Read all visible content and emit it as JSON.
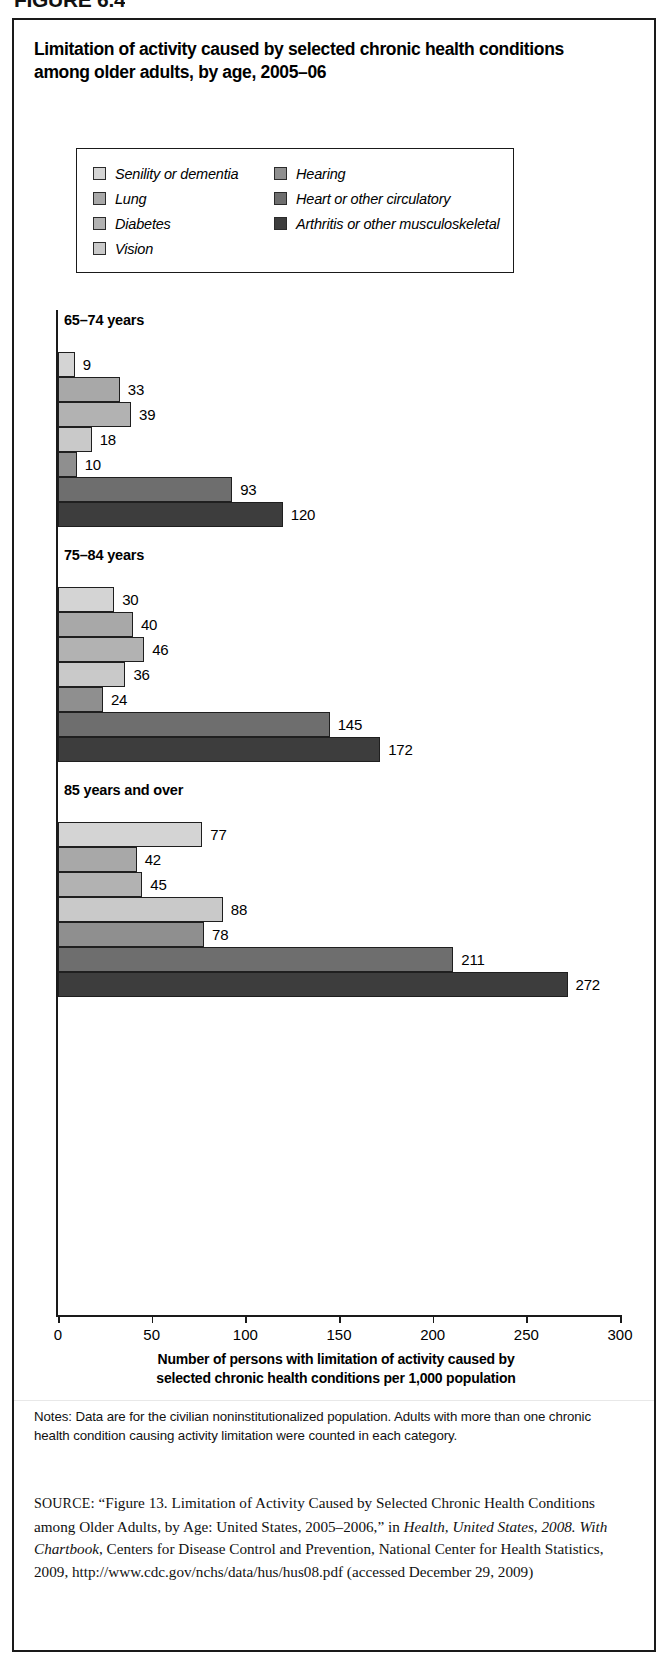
{
  "figure": {
    "caption": "FIGURE 6.4"
  },
  "chart": {
    "title": "Limitation of activity caused by selected chronic health conditions among older adults, by age, 2005–06",
    "axis_title_line1": "Number of persons with limitation of activity caused by",
    "axis_title_line2": "selected chronic health conditions per 1,000 population"
  },
  "legend": {
    "left": [
      {
        "label": "Senility or dementia",
        "color": "#d4d4d4"
      },
      {
        "label": "Lung",
        "color": "#a8a8a8"
      },
      {
        "label": "Diabetes",
        "color": "#b2b2b2"
      },
      {
        "label": "Vision",
        "color": "#c9c9c9"
      }
    ],
    "right": [
      {
        "label": "Hearing",
        "color": "#8f8f8f"
      },
      {
        "label": "Heart or other circulatory",
        "color": "#6e6e6e"
      },
      {
        "label": "Arthritis or other musculoskeletal",
        "color": "#3d3d3d"
      }
    ]
  },
  "notes": {
    "text": "Notes: Data are for the civilian noninstitutionalized population. Adults with more than one chronic health condition causing activity limitation were counted in each category."
  },
  "source": {
    "prefix": "SOURCE",
    "text_1": ": “Figure 13. Limitation of Activity Caused by Selected Chronic Health Conditions among Older Adults, by Age: United States, 2005–2006,” in ",
    "italic_1": "Health, United States, 2008. With Chartbook",
    "text_2": ", Centers for Disease Control and Prevention, National Center for Health Statistics, 2009, http://www.cdc.gov/nchs/data/hus/hus08.pdf (accessed December 29, 2009)"
  },
  "chart_data": {
    "type": "bar",
    "orientation": "horizontal",
    "title": "Limitation of activity caused by selected chronic health conditions among older adults, by age, 2005–06",
    "xlabel": "Number of persons with limitation of activity caused by selected chronic health conditions per 1,000 population",
    "ylabel": "",
    "xlim": [
      0,
      300
    ],
    "xticks": [
      0,
      50,
      100,
      150,
      200,
      250,
      300
    ],
    "grid": false,
    "legend_position": "top",
    "categories": [
      "Senility or dementia",
      "Lung",
      "Diabetes",
      "Vision",
      "Hearing",
      "Heart or other circulatory",
      "Arthritis or other musculoskeletal"
    ],
    "colors": [
      "#d4d4d4",
      "#a8a8a8",
      "#b2b2b2",
      "#c9c9c9",
      "#8f8f8f",
      "#6e6e6e",
      "#3d3d3d"
    ],
    "groups": [
      {
        "name": "65–74 years",
        "values": [
          9,
          33,
          39,
          18,
          10,
          93,
          120
        ]
      },
      {
        "name": "75–84 years",
        "values": [
          30,
          40,
          46,
          36,
          24,
          145,
          172
        ]
      },
      {
        "name": "85 years and over",
        "values": [
          77,
          42,
          45,
          88,
          78,
          211,
          272
        ]
      }
    ]
  }
}
